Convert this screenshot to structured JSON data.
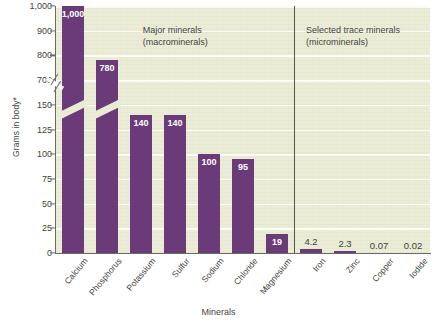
{
  "chart_data": {
    "type": "bar",
    "title": "",
    "xlabel": "Minerals",
    "ylabel": "Grams in body*",
    "categories": [
      "Calcium",
      "Phosphorus",
      "Potassium",
      "Sulfur",
      "Sodium",
      "Chloride",
      "Magnesium",
      "Iron",
      "Zinc",
      "Copper",
      "Iodide"
    ],
    "values": [
      1000,
      780,
      140,
      140,
      100,
      95,
      19,
      4.2,
      2.3,
      0.07,
      0.02
    ],
    "value_labels": [
      "1,000",
      "780",
      "140",
      "140",
      "100",
      "95",
      "19",
      "4.2",
      "2.3",
      "0.07",
      "0.02"
    ],
    "ytick_labels": [
      "0",
      "25",
      "50",
      "75",
      "100",
      "125",
      "150",
      "700",
      "800",
      "900",
      "1,000"
    ],
    "ytick_values": [
      0,
      25,
      50,
      75,
      100,
      125,
      150,
      700,
      800,
      900,
      1000
    ],
    "axis_break": {
      "present": true,
      "between": [
        150,
        700
      ]
    },
    "ylim": [
      0,
      1000
    ],
    "grid": "horizontal",
    "legend": "none",
    "annotations": [
      {
        "line1": "Major minerals",
        "line2": "(macrominerals)"
      },
      {
        "line1": "Selected trace minerals",
        "line2": "(microminerals)"
      }
    ],
    "groups": [
      {
        "name": "Major minerals (macrominerals)",
        "categories": [
          "Calcium",
          "Phosphorus",
          "Potassium",
          "Sulfur",
          "Sodium",
          "Chloride",
          "Magnesium"
        ]
      },
      {
        "name": "Selected trace minerals (microminerals)",
        "categories": [
          "Iron",
          "Zinc",
          "Copper",
          "Iodide"
        ]
      }
    ],
    "colors": {
      "bar": "#6b3a78",
      "plot_background": "#e9ebd4",
      "gridline": "#fbfcf3",
      "axis": "#6a6a62",
      "divider": "#55554d",
      "text": "#3f3f3b",
      "value_label_inside": "#ffffff"
    }
  }
}
